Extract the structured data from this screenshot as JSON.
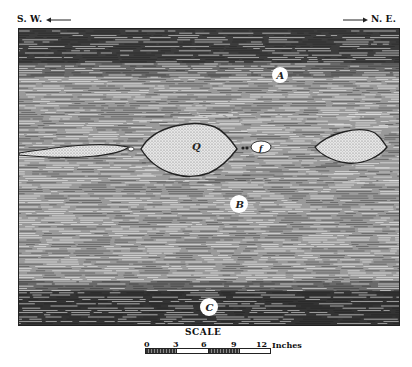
{
  "orientation": {
    "left": "S. W.",
    "right": "N. E.",
    "left_arrow": "left-arrow",
    "right_arrow": "right-arrow"
  },
  "layers": [
    {
      "id": "A",
      "label": "A",
      "description": "upper dark laminated layer"
    },
    {
      "id": "B",
      "label": "B",
      "description": "middle finely laminated layer with lenses"
    },
    {
      "id": "C",
      "label": "C",
      "description": "lower dark laminated layer"
    }
  ],
  "lenses": {
    "main_label": "Q",
    "small_label": "f"
  },
  "scale": {
    "title": "SCALE",
    "ticks": [
      "0",
      "3",
      "6",
      "9",
      "12"
    ],
    "units": "Inches"
  },
  "colors": {
    "ink": "#222222",
    "paper": "#ffffff",
    "dark_layer": "#3a3a3a",
    "mid_layer": "#7a7a7a",
    "lens_fill": "#d8d8d8"
  }
}
